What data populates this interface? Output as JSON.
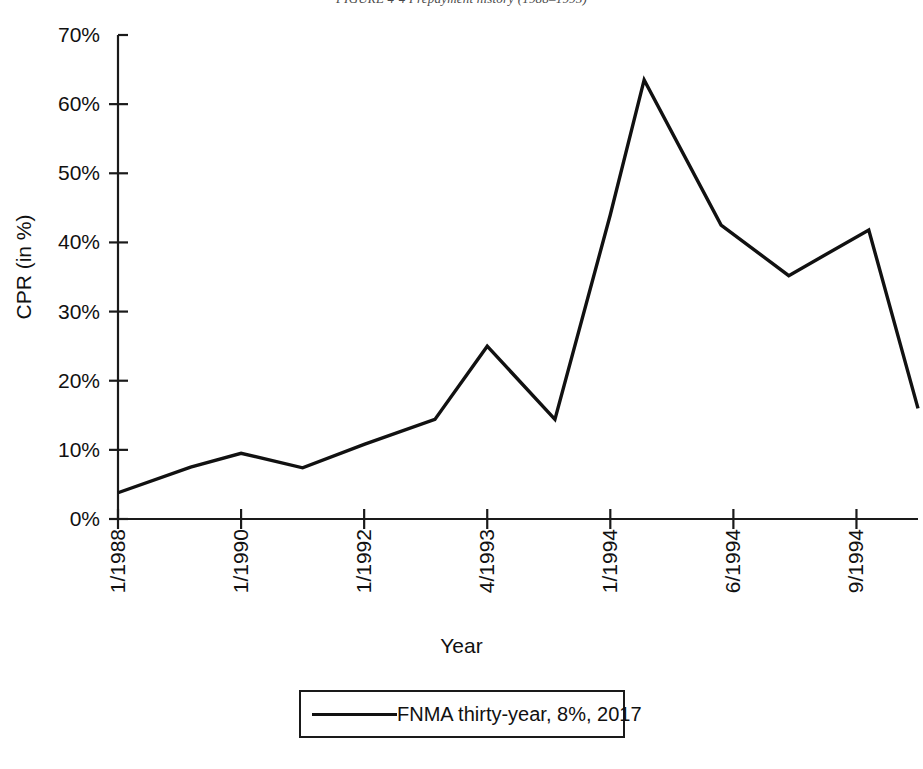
{
  "figure": {
    "caption": "FIGURE 4-4  Prepayment history (1988–1995)"
  },
  "legend": {
    "entry_label": "FNMA thirty-year, 8%, 2017"
  },
  "chart_data": {
    "type": "line",
    "title": "FIGURE 4-4  Prepayment history (1988–1995)",
    "xlabel": "Year",
    "ylabel": "CPR (in %)",
    "ylim": [
      0,
      70
    ],
    "ytick_labels": [
      "0%",
      "10%",
      "20%",
      "30%",
      "40%",
      "50%",
      "60%",
      "70%"
    ],
    "ytick_values": [
      0,
      10,
      20,
      30,
      40,
      50,
      60,
      70
    ],
    "xtick_labels": [
      "1/1988",
      "1/1990",
      "1/1992",
      "4/1993",
      "1/1994",
      "6/1994",
      "9/1994"
    ],
    "xtick_positions": [
      0,
      2,
      4,
      6,
      8,
      10,
      12
    ],
    "xlim": [
      0,
      13
    ],
    "grid": false,
    "legend_position": "below-plot",
    "series": [
      {
        "name": "FNMA thirty-year, 8%, 2017",
        "x": [
          0,
          1.18,
          2,
          3,
          4,
          5.15,
          6,
          7.1,
          8,
          8.55,
          9.8,
          10.9,
          12.2,
          13
        ],
        "values": [
          3.8,
          7.5,
          9.5,
          7.4,
          10.8,
          14.4,
          25.0,
          14.4,
          44.0,
          63.5,
          42.5,
          35.2,
          41.8,
          16.0
        ]
      }
    ]
  }
}
